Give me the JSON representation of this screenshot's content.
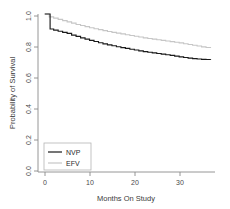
{
  "chart_data": {
    "type": "line",
    "subtype": "kaplan-meier-step",
    "title": "",
    "xlabel": "Months On Study",
    "ylabel": "Probability of Survival",
    "xlim": [
      -1.5,
      38
    ],
    "ylim": [
      0.0,
      1.0
    ],
    "xticks": [
      0,
      10,
      20,
      30
    ],
    "xtick_labels": [
      "0",
      "10",
      "20",
      "30"
    ],
    "yticks": [
      0.0,
      0.2,
      0.4,
      0.6,
      0.8,
      1.0
    ],
    "ytick_labels": [
      "0.0",
      "0.2",
      "0.4",
      "0.6",
      "0.8",
      "1.0"
    ],
    "grid": false,
    "legend_position": "bottom-left",
    "series": [
      {
        "name": "NVP",
        "color": "#1a1a1a",
        "style": "step",
        "x": [
          0,
          1.0,
          1.2,
          2.0,
          3.0,
          4.0,
          5.0,
          6.0,
          7.0,
          8.0,
          9.0,
          10.0,
          11.0,
          12.0,
          13.0,
          14.0,
          15.0,
          16.0,
          17.0,
          18.0,
          19.0,
          20.0,
          21.0,
          22.0,
          23.0,
          24.0,
          25.0,
          26.0,
          27.0,
          28.0,
          29.0,
          30.0,
          31.0,
          32.0,
          33.0,
          34.0,
          35.0,
          36.0,
          37.0
        ],
        "y": [
          1.0,
          1.0,
          0.905,
          0.898,
          0.891,
          0.884,
          0.877,
          0.866,
          0.858,
          0.849,
          0.841,
          0.833,
          0.826,
          0.818,
          0.811,
          0.805,
          0.799,
          0.793,
          0.787,
          0.782,
          0.777,
          0.772,
          0.767,
          0.762,
          0.758,
          0.754,
          0.75,
          0.746,
          0.742,
          0.738,
          0.733,
          0.729,
          0.725,
          0.721,
          0.718,
          0.715,
          0.713,
          0.712,
          0.711
        ]
      },
      {
        "name": "EFV",
        "color": "#c6c6c6",
        "style": "step",
        "x": [
          0,
          1.0,
          2.0,
          3.0,
          4.0,
          5.0,
          6.0,
          7.0,
          8.0,
          9.0,
          10.0,
          11.0,
          12.0,
          13.0,
          14.0,
          15.0,
          16.0,
          17.0,
          18.0,
          19.0,
          20.0,
          21.0,
          22.0,
          23.0,
          24.0,
          25.0,
          26.0,
          27.0,
          28.0,
          29.0,
          30.0,
          31.0,
          32.0,
          33.0,
          34.0,
          35.0,
          36.0,
          37.0
        ],
        "y": [
          1.0,
          0.982,
          0.974,
          0.966,
          0.958,
          0.95,
          0.942,
          0.934,
          0.927,
          0.92,
          0.913,
          0.907,
          0.901,
          0.895,
          0.889,
          0.884,
          0.879,
          0.874,
          0.869,
          0.864,
          0.859,
          0.854,
          0.849,
          0.845,
          0.841,
          0.837,
          0.833,
          0.829,
          0.825,
          0.821,
          0.817,
          0.812,
          0.807,
          0.802,
          0.797,
          0.792,
          0.788,
          0.785
        ]
      }
    ],
    "legend_entries": [
      {
        "label": "NVP",
        "color": "#1a1a1a",
        "has_line_swatch": true
      },
      {
        "label": "EFV",
        "color": "#c6c6c6",
        "has_line_swatch": true
      }
    ],
    "colors": {
      "nvp": "#1a1a1a",
      "efv": "#c6c6c6",
      "axis": "#8a8a8a",
      "text": "#3a3a3a",
      "background": "#ffffff"
    }
  }
}
